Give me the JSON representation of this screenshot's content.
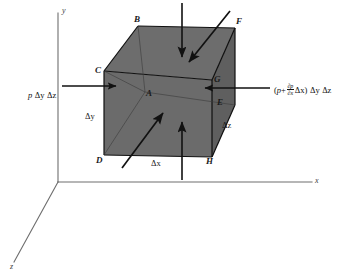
{
  "figure": {
    "type": "3d-free-body-diagram",
    "background_color": "#ffffff",
    "face_fill_color": "#6b6b6b",
    "face_top_color": "#6e6e6e",
    "face_side_color": "#636363",
    "edge_color": "#111111",
    "axis_color": "#6e6e6e",
    "arrow_color": "#111111"
  },
  "axes": {
    "y_label": "y",
    "x_label": "x",
    "z_label": "z",
    "origin": {
      "x": 58,
      "y": 182
    }
  },
  "cube": {
    "vertices": {
      "A": {
        "label": "A",
        "x": 145,
        "y": 92
      },
      "B": {
        "label": "B",
        "x": 138,
        "y": 26
      },
      "C": {
        "label": "C",
        "x": 104,
        "y": 71
      },
      "D": {
        "label": "D",
        "x": 104,
        "y": 155
      },
      "E": {
        "label": "E",
        "x": 215,
        "y": 100
      },
      "F": {
        "label": "F",
        "x": 235,
        "y": 28
      },
      "G": {
        "label": "G",
        "x": 212,
        "y": 80
      },
      "H": {
        "label": "H",
        "x": 212,
        "y": 157
      }
    }
  },
  "dimensions": [
    {
      "name": "delta-x-bottom",
      "label": "Δx"
    },
    {
      "name": "delta-y-left",
      "label": "Δy"
    },
    {
      "name": "delta-z-right",
      "label": "Δz"
    }
  ],
  "forces": {
    "left": {
      "name": "pressure-force-left",
      "text": "p Δy Δz",
      "parts": {
        "p": "p",
        "dy": "Δy",
        "dz": "Δz"
      },
      "direction": "right"
    },
    "right": {
      "name": "pressure-force-right",
      "text": "(p + ∂p/∂x Δx) Δy Δz",
      "parts": {
        "open": "(",
        "p": "p",
        "plus": "+",
        "num": "∂p",
        "den": "∂x",
        "dx": "Δx",
        "close": ")",
        "dy": "Δy",
        "dz": "Δz"
      },
      "direction": "left"
    }
  },
  "arrows": [
    {
      "name": "arrow-top-down",
      "direction": "down"
    },
    {
      "name": "arrow-bottom-up",
      "direction": "up"
    },
    {
      "name": "arrow-back-diagonal",
      "direction": "down-left"
    },
    {
      "name": "arrow-front-diagonal",
      "direction": "up-right"
    },
    {
      "name": "arrow-left-inward",
      "direction": "right"
    },
    {
      "name": "arrow-right-inward",
      "direction": "left"
    }
  ]
}
